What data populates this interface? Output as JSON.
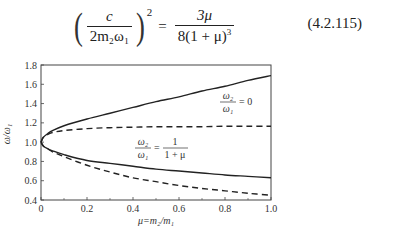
{
  "equation": {
    "lhs_numerator": "c",
    "lhs_denominator": "2m₂ω₁",
    "lhs_exponent": "2",
    "equals": "=",
    "rhs_numerator": "3μ",
    "rhs_denominator": "8(1 + μ)",
    "rhs_denominator_exponent": "3",
    "number": "(4.2.115)"
  },
  "chart_data": {
    "type": "line",
    "title": "",
    "xlabel": "μ=m₂/m₁",
    "ylabel": "ω/ω₁",
    "xlim": [
      0,
      1.0
    ],
    "ylim": [
      0.4,
      1.8
    ],
    "xticks": [
      "0",
      "0.2",
      "0.4",
      "0.6",
      "0.8",
      "1.0"
    ],
    "yticks": [
      "0.4",
      "0.6",
      "0.8",
      "1.0",
      "1.2",
      "1.4",
      "1.6",
      "1.8"
    ],
    "grid": false,
    "annotations": [
      {
        "text_num": "ω₂",
        "text_den": "ω₁",
        "text_rhs": "= 0",
        "refers_to": "solid"
      },
      {
        "text_num": "ω₂",
        "text_den": "ω₁",
        "text_rhs_num": "1",
        "text_rhs_den": "1 + μ",
        "refers_to": "dashed"
      }
    ],
    "x": [
      0,
      0.01,
      0.03,
      0.05,
      0.1,
      0.2,
      0.3,
      0.4,
      0.5,
      0.6,
      0.7,
      0.8,
      0.9,
      1.0
    ],
    "series": [
      {
        "name": "ω₂/ω₁=0 upper",
        "style": "solid",
        "values": [
          1.0,
          1.05,
          1.09,
          1.12,
          1.17,
          1.24,
          1.3,
          1.36,
          1.42,
          1.47,
          1.53,
          1.58,
          1.64,
          1.69
        ]
      },
      {
        "name": "ω₂/ω₁=0 lower",
        "style": "solid",
        "values": [
          1.0,
          0.96,
          0.93,
          0.91,
          0.87,
          0.81,
          0.78,
          0.75,
          0.72,
          0.7,
          0.68,
          0.66,
          0.645,
          0.63
        ]
      },
      {
        "name": "ω₂/ω₁=1/(1+μ) upper",
        "style": "dashed",
        "values": [
          1.0,
          1.05,
          1.08,
          1.1,
          1.12,
          1.14,
          1.15,
          1.155,
          1.16,
          1.16,
          1.16,
          1.165,
          1.165,
          1.165
        ]
      },
      {
        "name": "ω₂/ω₁=1/(1+μ) lower",
        "style": "dashed",
        "values": [
          1.0,
          0.96,
          0.93,
          0.9,
          0.85,
          0.76,
          0.69,
          0.63,
          0.59,
          0.55,
          0.52,
          0.495,
          0.47,
          0.45
        ]
      }
    ]
  }
}
